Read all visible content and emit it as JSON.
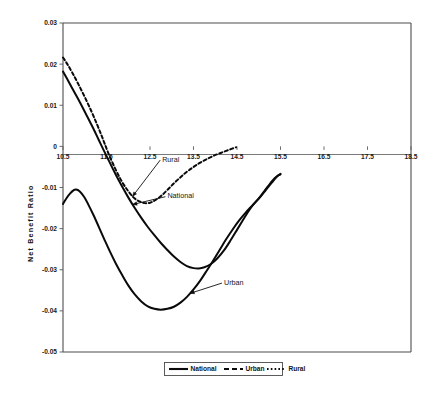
{
  "chart_data": {
    "type": "line",
    "title": "",
    "subtitle": "",
    "xlabel": "",
    "ylabel": "Net Benefit Ratio",
    "xlim": [
      10.5,
      18.5
    ],
    "ylim": [
      -0.05,
      0.03
    ],
    "grid": false,
    "legend_position": "bottom-center",
    "x_ticks": [
      "10.5",
      "11.5",
      "12.5",
      "13.5",
      "14.5",
      "15.5",
      "16.5",
      "17.5",
      "18.5"
    ],
    "x_tick_values": [
      10.5,
      11.5,
      12.5,
      13.5,
      14.5,
      15.5,
      16.5,
      17.5,
      18.5
    ],
    "y_ticks": [
      "0.03",
      "0.02",
      "0.01",
      "0",
      "-0.01",
      "-0.02",
      "-0.03",
      "-0.04",
      "-0.05"
    ],
    "y_tick_values": [
      0.03,
      0.02,
      0.01,
      0,
      -0.01,
      -0.02,
      -0.03,
      -0.04,
      -0.05
    ],
    "series": [
      {
        "name": "National",
        "style": "solid",
        "color": "#0a0a0a",
        "points": [
          [
            10.5,
            0.0182
          ],
          [
            10.6,
            0.0163
          ],
          [
            10.75,
            0.0134
          ],
          [
            10.9,
            0.0105
          ],
          [
            11.05,
            0.0074
          ],
          [
            11.2,
            0.0043
          ],
          [
            11.32,
            0.0016
          ],
          [
            11.42,
            -0.0006
          ],
          [
            11.55,
            -0.0034
          ],
          [
            11.7,
            -0.0066
          ],
          [
            11.85,
            -0.0096
          ],
          [
            12.0,
            -0.0124
          ],
          [
            12.15,
            -0.015
          ],
          [
            12.3,
            -0.0174
          ],
          [
            12.45,
            -0.0196
          ],
          [
            12.6,
            -0.0216
          ],
          [
            12.75,
            -0.0235
          ],
          [
            12.9,
            -0.0252
          ],
          [
            13.05,
            -0.0268
          ],
          [
            13.2,
            -0.0281
          ],
          [
            13.35,
            -0.0291
          ],
          [
            13.5,
            -0.0296
          ],
          [
            13.62,
            -0.0297
          ],
          [
            13.75,
            -0.0294
          ],
          [
            13.9,
            -0.0286
          ],
          [
            14.05,
            -0.0272
          ],
          [
            14.2,
            -0.0253
          ],
          [
            14.35,
            -0.0229
          ],
          [
            14.5,
            -0.0203
          ],
          [
            14.62,
            -0.0182
          ],
          [
            14.72,
            -0.0165
          ],
          [
            14.82,
            -0.0149
          ],
          [
            14.92,
            -0.0136
          ],
          [
            15.02,
            -0.0124
          ],
          [
            15.12,
            -0.011
          ],
          [
            15.22,
            -0.0096
          ],
          [
            15.32,
            -0.0083
          ],
          [
            15.42,
            -0.0073
          ],
          [
            15.5,
            -0.0068
          ]
        ]
      },
      {
        "name": "Urban",
        "style": "dashed",
        "color": "#0a0a0a",
        "points": [
          [
            10.5,
            -0.014
          ],
          [
            10.58,
            -0.0126
          ],
          [
            10.66,
            -0.0115
          ],
          [
            10.74,
            -0.0107
          ],
          [
            10.8,
            -0.0105
          ],
          [
            10.88,
            -0.0109
          ],
          [
            10.98,
            -0.0122
          ],
          [
            11.08,
            -0.0141
          ],
          [
            11.2,
            -0.0167
          ],
          [
            11.32,
            -0.0195
          ],
          [
            11.45,
            -0.0226
          ],
          [
            11.58,
            -0.0256
          ],
          [
            11.72,
            -0.0286
          ],
          [
            11.86,
            -0.0313
          ],
          [
            12.0,
            -0.0338
          ],
          [
            12.15,
            -0.036
          ],
          [
            12.3,
            -0.0377
          ],
          [
            12.45,
            -0.0389
          ],
          [
            12.6,
            -0.0395
          ],
          [
            12.75,
            -0.0397
          ],
          [
            12.9,
            -0.0395
          ],
          [
            13.05,
            -0.039
          ],
          [
            13.2,
            -0.038
          ],
          [
            13.35,
            -0.0366
          ],
          [
            13.5,
            -0.0348
          ],
          [
            13.65,
            -0.0327
          ],
          [
            13.8,
            -0.0303
          ],
          [
            13.95,
            -0.0278
          ],
          [
            14.1,
            -0.0252
          ],
          [
            14.25,
            -0.0226
          ],
          [
            14.4,
            -0.0202
          ],
          [
            14.55,
            -0.018
          ],
          [
            14.7,
            -0.0161
          ],
          [
            14.85,
            -0.0144
          ],
          [
            15.0,
            -0.0127
          ],
          [
            15.15,
            -0.0108
          ],
          [
            15.3,
            -0.0088
          ],
          [
            15.42,
            -0.0073
          ],
          [
            15.5,
            -0.0067
          ]
        ]
      },
      {
        "name": "Rural",
        "style": "dotted",
        "color": "#0a0a0a",
        "points": [
          [
            10.5,
            0.0216
          ],
          [
            10.6,
            0.02
          ],
          [
            10.72,
            0.0178
          ],
          [
            10.85,
            0.0152
          ],
          [
            11.0,
            0.012
          ],
          [
            11.15,
            0.0086
          ],
          [
            11.28,
            0.0054
          ],
          [
            11.38,
            0.0028
          ],
          [
            11.46,
            0.0006
          ],
          [
            11.56,
            -0.0021
          ],
          [
            11.7,
            -0.0054
          ],
          [
            11.84,
            -0.0083
          ],
          [
            11.98,
            -0.0106
          ],
          [
            12.12,
            -0.0124
          ],
          [
            12.26,
            -0.0134
          ],
          [
            12.38,
            -0.0138
          ],
          [
            12.5,
            -0.0137
          ],
          [
            12.62,
            -0.0131
          ],
          [
            12.76,
            -0.012
          ],
          [
            12.9,
            -0.0106
          ],
          [
            13.04,
            -0.0091
          ],
          [
            13.18,
            -0.0077
          ],
          [
            13.32,
            -0.0064
          ],
          [
            13.46,
            -0.0053
          ],
          [
            13.6,
            -0.0043
          ],
          [
            13.75,
            -0.0034
          ],
          [
            13.9,
            -0.0026
          ],
          [
            14.05,
            -0.0019
          ],
          [
            14.2,
            -0.0013
          ],
          [
            14.35,
            -0.0007
          ],
          [
            14.48,
            -0.0002
          ]
        ]
      }
    ],
    "annotations": [
      {
        "text": "Rural",
        "label_x": 12.78,
        "label_y": -0.0037
      },
      {
        "text": "National",
        "label_x": 12.9,
        "label_y": -0.0126
      },
      {
        "text": "Urban",
        "label_x": 14.2,
        "label_y": -0.0336
      }
    ]
  },
  "legend": {
    "entries": [
      {
        "label": "National",
        "style": "solid"
      },
      {
        "label": "Urban",
        "style": "dashed"
      },
      {
        "label": "Rural",
        "style": "dotted"
      }
    ]
  },
  "axes": {
    "y_title": "Net Benefit Ratio"
  }
}
